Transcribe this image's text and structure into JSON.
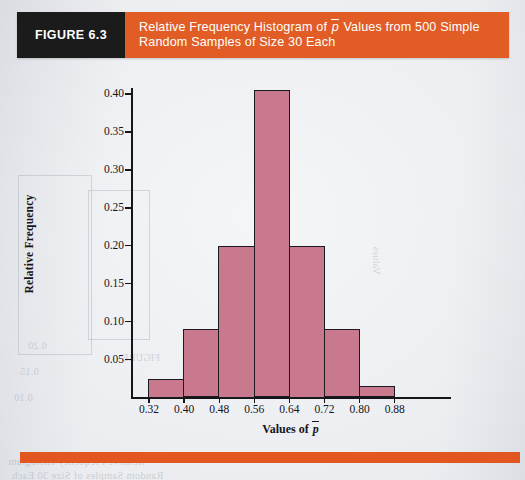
{
  "figure": {
    "label": "FIGURE 6.3",
    "caption": "Relative Frequency Histogram of p̄ Values from 500 Simple Random Samples of Size 30 Each",
    "caption_line1_pre": "Relative Frequency Histogram of ",
    "caption_line1_symbol": "p",
    "caption_line1_post": " Values from 500 Simple",
    "caption_line2": "Random Samples of Size 30 Each"
  },
  "colors": {
    "banner_orange": "#e15d25",
    "figure_box_black": "#1b1b1b",
    "bar_fill": "#c9798e",
    "bar_outline": "#1a1a20",
    "page_background": "#e8eaee",
    "axis": "#16161a"
  },
  "axis_titles": {
    "x_prefix": "Values of ",
    "x_symbol": "p",
    "y": "Relative Frequency"
  },
  "chart_data": {
    "type": "bar",
    "subtitle": "",
    "xlabel": "Values of p̄",
    "ylabel": "Relative Frequency",
    "grid": false,
    "legend": "none",
    "xlim": [
      0.24,
      0.96
    ],
    "ylim": [
      0.0,
      0.42
    ],
    "xticks": [
      "0.32",
      "0.40",
      "0.48",
      "0.56",
      "0.64",
      "0.72",
      "0.80",
      "0.88"
    ],
    "xtick_values": [
      0.32,
      0.4,
      0.48,
      0.56,
      0.64,
      0.72,
      0.8,
      0.88
    ],
    "yticks": [
      "0.05",
      "0.10",
      "0.15",
      "0.20",
      "0.25",
      "0.30",
      "0.35",
      "0.40"
    ],
    "ytick_values": [
      0.05,
      0.1,
      0.15,
      0.2,
      0.25,
      0.3,
      0.35,
      0.4
    ],
    "bin_width": 0.08,
    "categories": [
      "0.32-0.40",
      "0.40-0.48",
      "0.48-0.56",
      "0.56-0.64",
      "0.64-0.72",
      "0.72-0.80",
      "0.80-0.88"
    ],
    "bin_starts": [
      0.32,
      0.4,
      0.48,
      0.56,
      0.64,
      0.72,
      0.8
    ],
    "bin_ends": [
      0.4,
      0.48,
      0.56,
      0.64,
      0.72,
      0.8,
      0.88
    ],
    "values": [
      0.025,
      0.09,
      0.2,
      0.405,
      0.2,
      0.09,
      0.015
    ]
  },
  "ghost_text": {
    "g1": "Random Samples of Size 30 Each",
    "g2": "Relative Frequency Histogram",
    "g3": "FIGURE",
    "g4": "0.20",
    "g5": "0.15",
    "g6": "0.10",
    "g7": "Values"
  }
}
